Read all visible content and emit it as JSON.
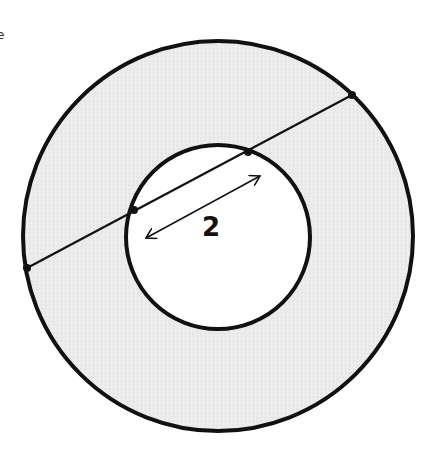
{
  "diagram": {
    "type": "annulus",
    "outer_circle": {
      "cx": 218,
      "cy": 236,
      "r": 195
    },
    "inner_circle": {
      "cx": 218,
      "cy": 237,
      "r": 92
    },
    "chord": {
      "x1": 27,
      "y1": 268,
      "x2": 352,
      "y2": 95
    },
    "chord_points": [
      {
        "x": 27,
        "y": 268
      },
      {
        "x": 134,
        "y": 210
      },
      {
        "x": 248,
        "y": 152
      },
      {
        "x": 352,
        "y": 95
      }
    ],
    "dimension_arrow": {
      "x1": 146,
      "y1": 238,
      "x2": 260,
      "y2": 176
    },
    "dimension_label": "2",
    "fill_color": "#ebebeb",
    "inner_fill": "#ffffff",
    "stroke_color": "#111111",
    "edge_fragment": "e"
  }
}
